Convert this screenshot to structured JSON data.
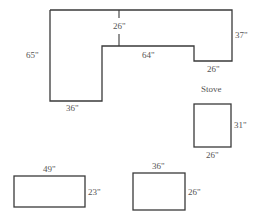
{
  "diagram": {
    "type": "kitchen-floor-plan",
    "counter": {
      "name": "L-shaped counter",
      "labels": {
        "left_height": "65\"",
        "bottom_width": "36\"",
        "depth": "26\"",
        "inner_length": "64\"",
        "right_height": "37\"",
        "right_step": "26\""
      }
    },
    "stove": {
      "title": "Stove",
      "width": "26\"",
      "height": "31\""
    },
    "table_left": {
      "width": "49\"",
      "height": "23\""
    },
    "table_right": {
      "width": "36\"",
      "height": "26\""
    },
    "colors": {
      "stroke": "#3a3a3a",
      "text": "#555555",
      "background": "#ffffff"
    }
  }
}
